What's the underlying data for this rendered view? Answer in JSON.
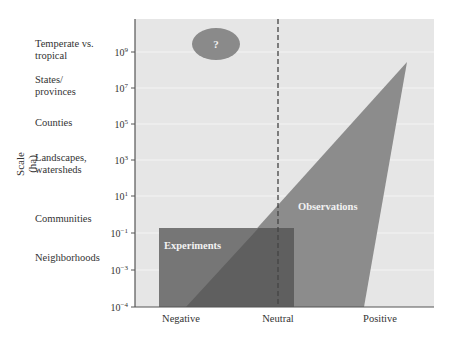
{
  "chart_data": {
    "type": "area",
    "title": "",
    "xlabel": "",
    "ylabel": "Scale (ha)",
    "x_categories": [
      "Negative",
      "Neutral",
      "Positive"
    ],
    "y_scale": "log10",
    "ylim": [
      0.0001,
      10000000000
    ],
    "y_ticks": [
      {
        "label": "10^9",
        "base": "10",
        "exp": "9",
        "value": 1000000000
      },
      {
        "label": "10^7",
        "base": "10",
        "exp": "7",
        "value": 10000000
      },
      {
        "label": "10^5",
        "base": "10",
        "exp": "5",
        "value": 100000
      },
      {
        "label": "10^3",
        "base": "10",
        "exp": "3",
        "value": 1000
      },
      {
        "label": "10^1",
        "base": "10",
        "exp": "1",
        "value": 10
      },
      {
        "label": "10^-1",
        "base": "10",
        "exp": "−1",
        "value": 0.1
      },
      {
        "label": "10^-3",
        "base": "10",
        "exp": "−3",
        "value": 0.001
      },
      {
        "label": "10^-4",
        "base": "10",
        "exp": "−4",
        "value": 0.0001
      }
    ],
    "scale_categories": [
      {
        "label": "Temperate vs.\ntropical",
        "approx_scale": "10^9"
      },
      {
        "label": "States/\nprovinces",
        "approx_scale": "10^7"
      },
      {
        "label": "Counties",
        "approx_scale": "10^5"
      },
      {
        "label": "Landscapes,\nwatersheds",
        "approx_scale": "10^3"
      },
      {
        "label": "Communities",
        "approx_scale": "10^0"
      },
      {
        "label": "Neighborhoods",
        "approx_scale": "10^-2"
      }
    ],
    "regions": [
      {
        "name": "Experiments",
        "shape": "rectangle",
        "x_range": [
          "Negative",
          "slightly right of Neutral"
        ],
        "y_range": [
          0.0001,
          0.2
        ],
        "color": "#767676"
      },
      {
        "name": "Observations",
        "shape": "triangle",
        "x_range": [
          "between Negative and Neutral",
          "Positive"
        ],
        "y_range": [
          0.0001,
          1000000000
        ],
        "apex": "Positive, ~10^8",
        "color": "#8c8c8c"
      },
      {
        "name": "?",
        "shape": "ellipse",
        "x_position": "between Negative and Neutral",
        "y_position": "~10^9.5",
        "color": "#8c8c8c"
      }
    ],
    "annotations": [
      {
        "text": "Neutral",
        "type": "vertical dashed line at x=Neutral"
      }
    ],
    "grid": true,
    "legend": "none"
  },
  "labels": {
    "y_axis": "Scale (ha)",
    "experiments": "Experiments",
    "observations": "Observations",
    "unknown": "?"
  },
  "colors": {
    "plot_bg": "#e6e6e6",
    "grid": "#f4f4f4",
    "observations": "#8c8c8c",
    "experiments": "#767676",
    "overlap": "#5f5f5f",
    "oval": "#8a8a8a",
    "text_on_dark": "#f2f2f2"
  }
}
